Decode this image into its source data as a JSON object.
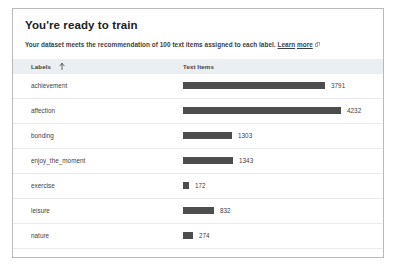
{
  "panel": {
    "title": "You're ready to train",
    "subtitle_text": "Your dataset meets the recommendation of 100 text items assigned to each label.",
    "link_text_part1": "Learn",
    "link_text_part2": "more",
    "link_icon": "external-link-icon"
  },
  "table": {
    "columns": [
      {
        "key": "labels",
        "header": "Labels",
        "sort_icon": "sort-ascending-arrow-icon",
        "sorted": "ascending"
      },
      {
        "key": "text_items",
        "header": "Text Items"
      }
    ],
    "rows": [
      {
        "label": "achievement",
        "value": "3791"
      },
      {
        "label": "affection",
        "value": "4232"
      },
      {
        "label": "bonding",
        "value": "1303"
      },
      {
        "label": "enjoy_the_moment",
        "value": "1343"
      },
      {
        "label": "exercise",
        "value": "172"
      },
      {
        "label": "leisure",
        "value": "832"
      },
      {
        "label": "nature",
        "value": "274"
      }
    ]
  },
  "chart_data": {
    "type": "bar",
    "categories": [
      "achievement",
      "affection",
      "bonding",
      "enjoy_the_moment",
      "exercise",
      "leisure",
      "nature"
    ],
    "values": [
      3791,
      4232,
      1303,
      1343,
      172,
      832,
      274
    ],
    "xlabel": "Text Items",
    "ylabel": "Labels",
    "xlim": [
      0,
      4232
    ],
    "orientation": "horizontal",
    "grid": false,
    "legend": false,
    "bar_color": "#4d4d4d",
    "value_labels": true
  },
  "colors": {
    "bar": "#4d4d4d",
    "header_row_bg": "#eceff1",
    "row_divider": "#e8eaed",
    "text": "#3c4043",
    "frame_border": "#b9b9b9"
  }
}
